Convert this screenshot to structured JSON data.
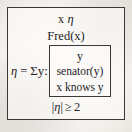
{
  "figure": {
    "kind": "drs-box-diagram",
    "background_color": "#f3f2ee",
    "ink_color": "#25231f",
    "border_color": "#3a3834"
  },
  "drs": {
    "referents": {
      "individual": "x",
      "sum": "η"
    },
    "condition_fred": "Fred(x)",
    "sum_condition": {
      "variable": "η",
      "equals": "=",
      "operator": "Σy:",
      "label": "η = Σy:"
    },
    "inner_box": {
      "referent": "y",
      "conditions": [
        "senator(y)",
        "x knows y"
      ]
    },
    "cardinality": {
      "left_bar": "|",
      "variable": "η",
      "right_bar": "|",
      "relation": "≥",
      "value": "2",
      "label": "|η| ≥ 2"
    }
  }
}
